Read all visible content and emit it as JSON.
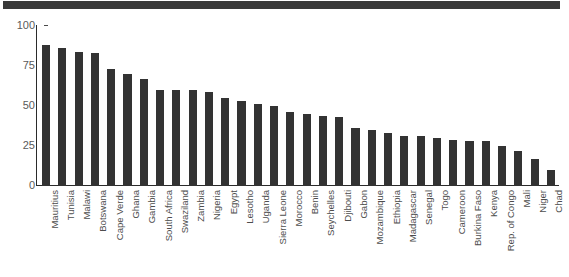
{
  "figure": {
    "background_color": "#ffffff",
    "bar_color": "#333333",
    "axis_color": "#2b2b2b",
    "tick_label_color": "#5a5a5a",
    "top_band_color": "#3a3a3a"
  },
  "chart_data": {
    "type": "bar",
    "title": "",
    "subtitle": "",
    "xlabel": "",
    "ylabel": "",
    "ylim": [
      0,
      100
    ],
    "yticks": [
      0,
      25,
      50,
      75,
      100
    ],
    "grid": false,
    "legend": null,
    "orientation": "vertical",
    "categories": [
      "Mauritius",
      "Tunisia",
      "Malawi",
      "Botswana",
      "Cape Verde",
      "Ghana",
      "Gambia",
      "South Africa",
      "Swaziland",
      "Zambia",
      "Nigeria",
      "Egypt",
      "Lesotho",
      "Uganda",
      "Sierra Leone",
      "Morocco",
      "Benin",
      "Seychelles",
      "Djibouti",
      "Gabon",
      "Mozambique",
      "Ethiopia",
      "Madagascar",
      "Senegal",
      "Togo",
      "Cameroon",
      "Burkina Faso",
      "Kenya",
      "Rep. of Congo",
      "Mali",
      "Niger",
      "Chad"
    ],
    "values": [
      88,
      86,
      84,
      83,
      73,
      70,
      67,
      60,
      60,
      60,
      59,
      55,
      53,
      51,
      50,
      46,
      45,
      44,
      43,
      36,
      35,
      33,
      31,
      31,
      30,
      29,
      28,
      28,
      25,
      22,
      17,
      10
    ]
  }
}
